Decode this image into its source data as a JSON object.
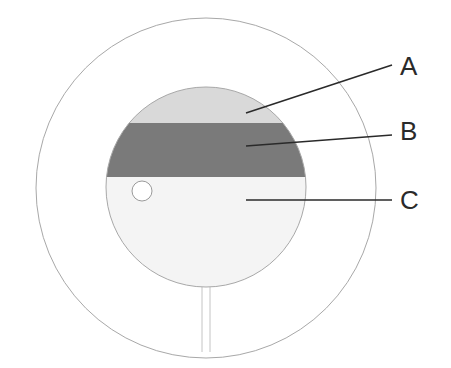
{
  "diagram": {
    "labels": [
      {
        "id": "A",
        "text": "A"
      },
      {
        "id": "B",
        "text": "B"
      },
      {
        "id": "C",
        "text": "C"
      }
    ],
    "colors": {
      "layer_a": "#d9d9d9",
      "layer_b": "#7a7a7a",
      "layer_c": "#f4f4f4",
      "outline": "#a8a8a8",
      "leader": "#2a2a2a"
    }
  }
}
